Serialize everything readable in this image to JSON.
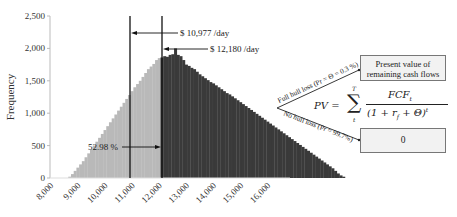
{
  "chart_data": {
    "type": "bar",
    "title": "",
    "xlabel": "",
    "ylabel": "Frequency",
    "xlim": [
      8000,
      16000
    ],
    "ylim": [
      0,
      2500
    ],
    "x_ticks": [
      "8,000",
      "9,000",
      "10,000",
      "11,000",
      "12,000",
      "13,000",
      "14,000",
      "15,000",
      "16,000"
    ],
    "y_ticks": [
      "0",
      "500",
      "1,000",
      "1,500",
      "2,000",
      "2,500"
    ],
    "bin_width": 100,
    "bin_start": 8600,
    "values": [
      20,
      60,
      110,
      160,
      210,
      260,
      320,
      380,
      440,
      500,
      560,
      620,
      680,
      740,
      800,
      860,
      920,
      980,
      1040,
      1100,
      1160,
      1220,
      1280,
      1340,
      1400,
      1450,
      1500,
      1560,
      1620,
      1680,
      1720,
      1760,
      1820,
      1850,
      1860,
      1880,
      1870,
      1900,
      1910,
      2000,
      1900,
      1880,
      1820,
      1750,
      1730,
      1700,
      1680,
      1640,
      1600,
      1570,
      1540,
      1510,
      1480,
      1460,
      1430,
      1400,
      1370,
      1340,
      1310,
      1290,
      1260,
      1230,
      1200,
      1170,
      1140,
      1110,
      1080,
      1050,
      1020,
      990,
      960,
      930,
      900,
      870,
      840,
      810,
      780,
      750,
      720,
      690,
      660,
      630,
      600,
      570,
      540,
      510,
      480,
      450,
      420,
      390,
      360,
      330,
      300,
      270,
      240,
      210,
      180,
      150,
      110,
      70,
      40,
      20
    ],
    "series_split": {
      "light_before": 12000,
      "dark_from": 12000
    },
    "colors": {
      "light": "#b9b9b9",
      "dark": "#3a3a3a",
      "axis": "#bbbbbb",
      "line": "#111111"
    },
    "annotations": [
      {
        "text": "$ 10,977 /day",
        "x": 10977
      },
      {
        "text": "$ 12,180 /day",
        "x": 12180
      },
      {
        "text": "52.98 %",
        "range": [
          10977,
          12180
        ]
      }
    ]
  },
  "annotations": {
    "line1_label": "$ 10,977 /day",
    "line2_label": "$ 12,180 /day",
    "pct_label": "52.98 %"
  },
  "diagram": {
    "branch_upper": "Full hull loss (Pr = Θ = 0.3 %)",
    "branch_lower": "No hull loss (Pr = 99.7%)",
    "box_upper_line1": "Present value of",
    "box_upper_line2": "remaining cash flows",
    "box_lower": "0",
    "formula_lhs": "PV =",
    "formula_sum_top": "T",
    "formula_sum_bottom": "t",
    "formula_numerator": "FCF",
    "formula_numerator_sub": "t",
    "formula_denominator": "(1 + r",
    "formula_denominator_sub": "f",
    "formula_denominator_rest": " + Θ)",
    "formula_denominator_sup": "t"
  }
}
